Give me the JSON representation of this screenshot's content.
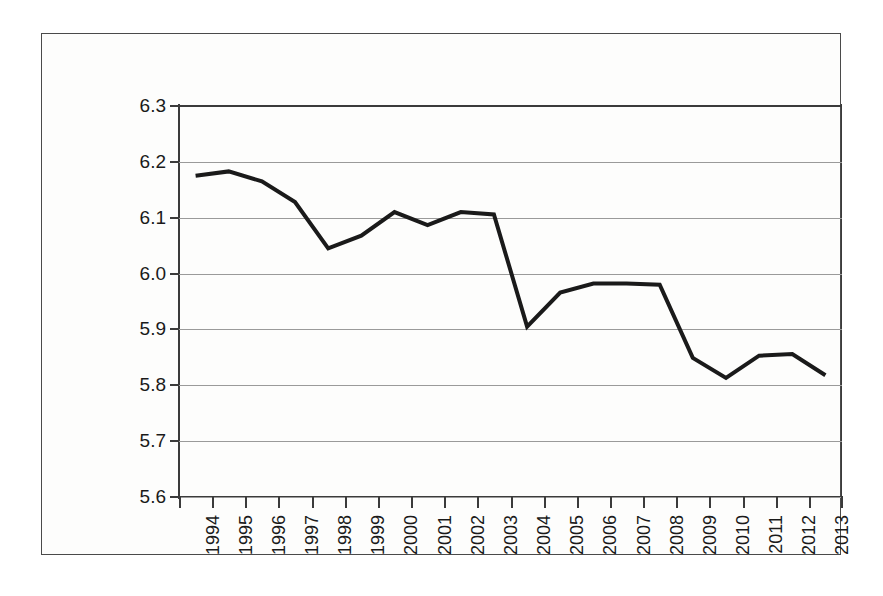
{
  "chart_data": {
    "type": "line",
    "title": "",
    "subtitle": "",
    "xlabel": "",
    "ylabel": "",
    "categories": [
      "1994",
      "1995",
      "1996",
      "1997",
      "1998",
      "1999",
      "2000",
      "2001",
      "2002",
      "2003",
      "2004",
      "2005",
      "2006",
      "2007",
      "2008",
      "2009",
      "2010",
      "2011",
      "2012",
      "2013"
    ],
    "series": [
      {
        "name": "value",
        "values": [
          6.175,
          6.183,
          6.165,
          6.128,
          6.045,
          6.068,
          6.11,
          6.087,
          6.11,
          6.106,
          5.905,
          5.966,
          5.982,
          5.982,
          5.98,
          5.849,
          5.813,
          5.853,
          5.856,
          5.818
        ]
      }
    ],
    "y_ticks": [
      "6.3",
      "6.2",
      "6.1",
      "6.0",
      "5.9",
      "5.8",
      "5.7",
      "5.6"
    ],
    "y_tick_values": [
      6.3,
      6.2,
      6.1,
      6.0,
      5.9,
      5.8,
      5.7,
      5.6
    ],
    "ylim": [
      5.6,
      6.3
    ],
    "y_tick_step": 0.1,
    "grid": true,
    "grid_axis": "y",
    "legend": "none",
    "line_color": "#1a1a1a",
    "line_width": 4,
    "markers": "none",
    "background_color": "#fdfdfc",
    "gridline_color": "#9a9a9a",
    "axis_color": "#3b3b3b"
  }
}
